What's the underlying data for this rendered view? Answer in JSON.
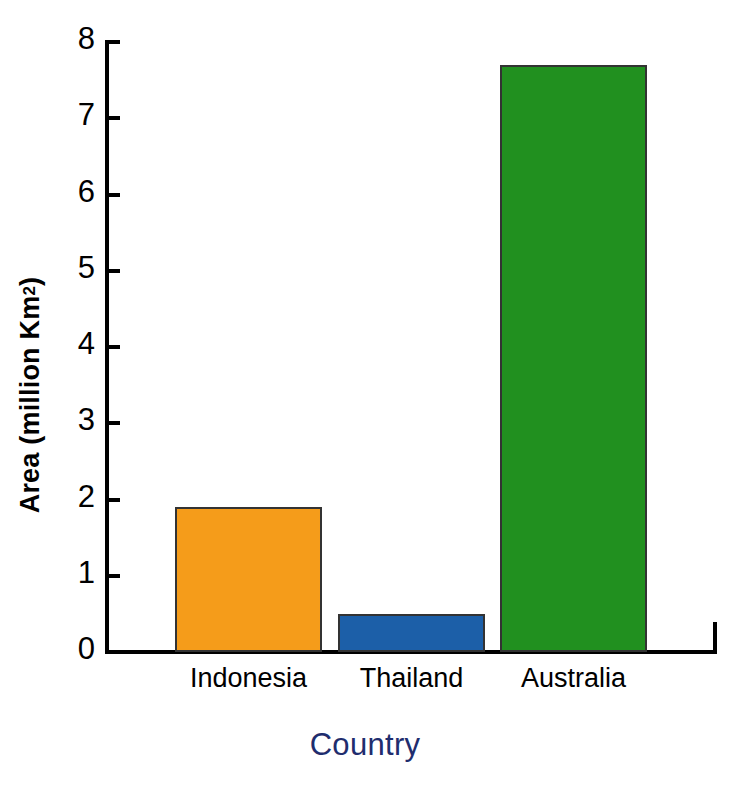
{
  "chart_data": {
    "type": "bar",
    "title": "",
    "xlabel": "Country",
    "ylabel": "Area (million Km²)",
    "ylabel_main": "Area (million Km",
    "ylabel_sup": "2",
    "ylabel_close": ")",
    "categories": [
      "Indonesia",
      "Thailand",
      "Australia"
    ],
    "values": [
      1.9,
      0.5,
      7.7
    ],
    "colors": [
      "#f59c1a",
      "#1c5fa8",
      "#21901f"
    ],
    "ylim": [
      0,
      8
    ],
    "yticks": [
      0,
      1,
      2,
      3,
      4,
      5,
      6,
      7,
      8
    ],
    "ytick_labels": [
      "0",
      "1",
      "2",
      "3",
      "4",
      "5",
      "6",
      "7",
      "8"
    ],
    "grid": false,
    "legend": false,
    "legend_position": "none",
    "xlabel_color": "#1f2d6e",
    "ylabel_color": "#000000",
    "axis_color": "#000000",
    "background": "#ffffff"
  }
}
